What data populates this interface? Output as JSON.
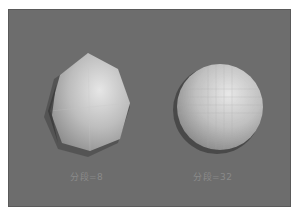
{
  "viewport": {
    "background": "#6d6d6d",
    "objects": [
      {
        "name": "low-poly-sphere",
        "label": "分段=8",
        "segments": 8
      },
      {
        "name": "smooth-sphere",
        "label": "分段=32",
        "segments": 32
      }
    ]
  }
}
